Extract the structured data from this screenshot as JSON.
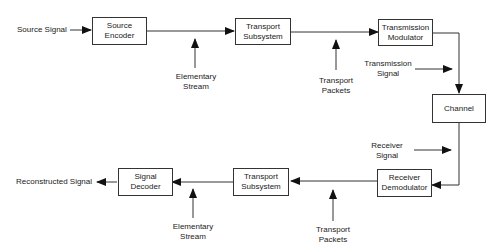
{
  "blocks": {
    "source_encoder": "Source\nEncoder",
    "transport_subsystem_top": "Transport\nSubsystem",
    "transmission_modulator": "Transmission\nModulator",
    "channel": "Channel",
    "receiver_demodulator": "Receiver\nDemodulator",
    "transport_subsystem_bottom": "Transport\nSubsystem",
    "signal_decoder": "Signal\nDecoder"
  },
  "labels": {
    "source_signal": "Source Signal",
    "elementary_stream_top": "Elementary\nStream",
    "transport_packets_top": "Transport\nPackets",
    "transmission_signal": "Transmission\nSignal",
    "receiver_signal": "Receiver\nSignal",
    "transport_packets_bottom": "Transport\nPackets",
    "elementary_stream_bottom": "Elementary\nStream",
    "reconstructed_signal": "Reconstructed Signal"
  }
}
